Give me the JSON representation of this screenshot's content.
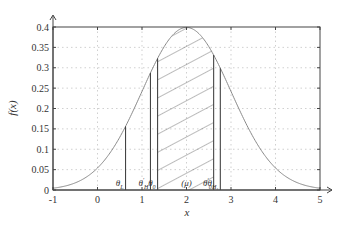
{
  "chart_data": {
    "type": "line",
    "title": "",
    "xlabel": "x",
    "ylabel": "f(x)",
    "xlim": [
      -1,
      5
    ],
    "ylim": [
      0,
      0.4
    ],
    "grid": true,
    "grid_style": "dotted",
    "legend": null,
    "x_ticks": [
      -1,
      0,
      1,
      2,
      3,
      4,
      5
    ],
    "x_tick_labels": [
      "-1",
      "0",
      "1",
      "2",
      "3",
      "4",
      "5"
    ],
    "y_ticks": [
      0,
      0.05,
      0.1,
      0.15,
      0.2,
      0.25,
      0.3,
      0.35,
      0.4
    ],
    "y_tick_labels": [
      "0",
      "0.05",
      "0.1",
      "0.15",
      "0.2",
      "0.25",
      "0.3",
      "0.35",
      "0.4"
    ],
    "series": [
      {
        "name": "normal density",
        "distribution": "normal",
        "mean": 2,
        "std": 1,
        "color": "#8a8a8a",
        "x": [
          -1,
          -0.5,
          0,
          0.5,
          1,
          1.5,
          2,
          2.5,
          3,
          3.5,
          4,
          4.5,
          5
        ],
        "values": [
          0.0044,
          0.0175,
          0.054,
          0.1295,
          0.242,
          0.352,
          0.399,
          0.352,
          0.242,
          0.1295,
          0.054,
          0.0175,
          0.0044
        ]
      }
    ],
    "shaded_region": {
      "from": 1.35,
      "to": 2.61,
      "pattern": "diagonal-hatch",
      "color": "#555555"
    },
    "vertical_markers": [
      {
        "label": "θ",
        "sub": "L",
        "sup": "",
        "x": 0.63
      },
      {
        "label": "θ",
        "sub": "H",
        "sup": "′",
        "x": 1.19
      },
      {
        "label": "θ",
        "sub": "0",
        "sup": "",
        "x": 1.35
      },
      {
        "label": "(μ)",
        "sub": "",
        "sup": "",
        "x": 2.0,
        "line": false
      },
      {
        "label": "θ",
        "sub": "0",
        "sup": "′",
        "x": 2.61
      },
      {
        "label": "θ",
        "sub": "H₁",
        "sup": "",
        "x": 2.76
      }
    ],
    "annotations": [
      "θL",
      "θ′H",
      "θ0",
      "(μ)",
      "θ′0",
      "θH1"
    ]
  }
}
